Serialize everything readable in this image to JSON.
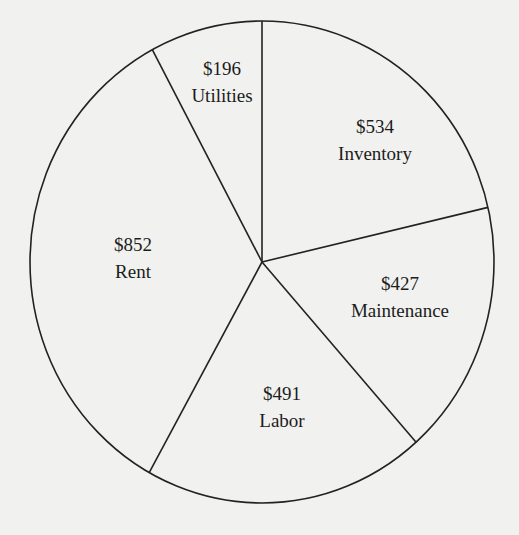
{
  "chart_data": {
    "type": "pie",
    "title": "",
    "categories": [
      "Inventory",
      "Maintenance",
      "Labor",
      "Rent",
      "Utilities"
    ],
    "values": [
      534,
      427,
      491,
      852,
      196
    ],
    "value_labels": [
      "$534",
      "$427",
      "$491",
      "$852",
      "$196"
    ],
    "total": 2500,
    "start_angle_deg": 0,
    "direction": "clockwise-from-top",
    "legend": "none (labels inside slices)",
    "colors": {
      "fill": "#f1f1ef",
      "stroke": "#222222"
    }
  },
  "labels": [
    {
      "value": "$534",
      "name": "Inventory",
      "x": 375,
      "y": 140
    },
    {
      "value": "$427",
      "name": "Maintenance",
      "x": 400,
      "y": 297
    },
    {
      "value": "$491",
      "name": "Labor",
      "x": 282,
      "y": 407
    },
    {
      "value": "$852",
      "name": "Rent",
      "x": 133,
      "y": 258
    },
    {
      "value": "$196",
      "name": "Utilities",
      "x": 222,
      "y": 82
    }
  ]
}
